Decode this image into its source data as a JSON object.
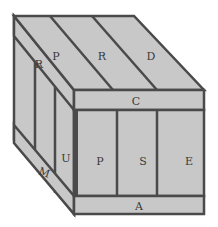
{
  "diagram": {
    "type": "wooden crate isometric sketch",
    "colors": {
      "fill": "#c8c8c8",
      "stroke": "#4a4a4a",
      "background": "#ffffff"
    },
    "labels": {
      "top_slats": [
        "P",
        "R",
        "D"
      ],
      "top_front_board": "C",
      "front_slats": [
        "P",
        "S",
        "E"
      ],
      "front_bottom_board": "A",
      "side_top_board": "R",
      "side_post": "U",
      "side_bottom_board": "M"
    }
  }
}
